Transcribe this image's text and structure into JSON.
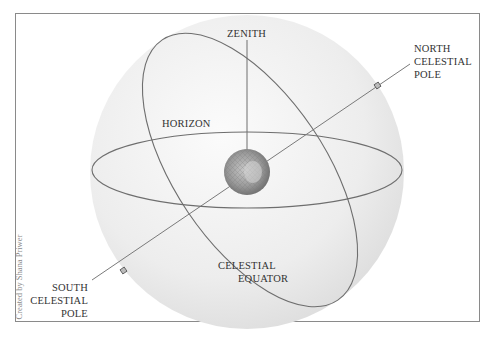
{
  "figure": {
    "credit": "Created by Shana Priwer",
    "labels": {
      "zenith": "ZENITH",
      "horizon": "HORIZON",
      "north_pole": [
        "NORTH",
        "CELESTIAL",
        "POLE"
      ],
      "south_pole": [
        "SOUTH",
        "CELESTIAL",
        "POLE"
      ],
      "celestial_equator": [
        "CELESTIAL",
        "EQUATOR"
      ]
    },
    "colors": {
      "sphere_fill": "#ececec",
      "line": "#6e6e6e",
      "earth": "#8c8c8c",
      "frame": "#8a8a8a",
      "text": "#333333"
    }
  }
}
